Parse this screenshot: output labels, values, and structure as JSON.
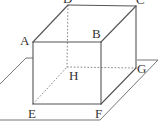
{
  "figure": {
    "type": "cuboid-on-plane",
    "vertices": {
      "A": {
        "label": "A",
        "x": 33,
        "y": 42
      },
      "B": {
        "label": "B",
        "x": 101,
        "y": 42
      },
      "C": {
        "label": "C",
        "x": 136,
        "y": 6
      },
      "D": {
        "label": "D",
        "x": 68,
        "y": 5
      },
      "E": {
        "label": "E",
        "x": 33,
        "y": 104
      },
      "F": {
        "label": "F",
        "x": 101,
        "y": 104
      },
      "G": {
        "label": "G",
        "x": 136,
        "y": 68
      },
      "H": {
        "label": "H",
        "x": 67,
        "y": 67
      }
    },
    "visible_edges": [
      "AB",
      "BC",
      "CD",
      "DA",
      "AE",
      "BF",
      "CG",
      "EF",
      "FG"
    ],
    "hidden_edges": [
      "DH",
      "EH",
      "GH"
    ],
    "colors": {
      "line": "#555555",
      "hidden_line": "#777777",
      "label": "#333333",
      "background": "#ffffff"
    }
  }
}
